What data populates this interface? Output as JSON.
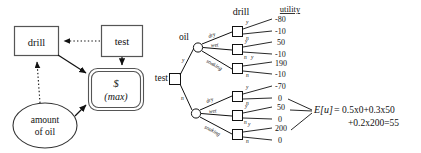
{
  "figure": {
    "title_hidden": "",
    "influence_diagram": {
      "nodes": {
        "drill_decision": "drill",
        "test_decision": "test",
        "utility_currency": "$",
        "utility_mode": "(max)",
        "chance_oil_line1": "amount",
        "chance_oil_line2": "of oil"
      }
    },
    "decision_tree": {
      "headers": {
        "drill": "drill",
        "utility": "utility"
      },
      "root": {
        "label": "test",
        "branches": [
          "y",
          "n"
        ]
      },
      "chance_nodes": [
        {
          "label": "oil",
          "branches": [
            "dry",
            "wet",
            "soaking"
          ]
        },
        {
          "label": "",
          "branches": [
            "dry",
            "wet",
            "soaking"
          ]
        }
      ],
      "drill_branches": [
        "y",
        "n"
      ],
      "utilities": [
        "-80",
        "-10",
        "50",
        "-10",
        "190",
        "-10",
        "-70",
        "0",
        "50",
        "0",
        "200",
        "0"
      ],
      "expectation": {
        "lhs": "E[u]",
        "eq": "=",
        "line1": "0.5x0+0.3x50",
        "line2": "+0.2x200=55"
      }
    }
  },
  "colors": {
    "stroke": "#111111",
    "box_border": "#555555",
    "background": "#ffffff"
  }
}
